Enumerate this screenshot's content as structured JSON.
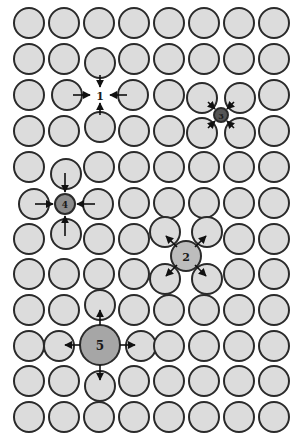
{
  "figure": {
    "type": "crystal-lattice-point-defects",
    "background": "#ffffff",
    "atom_fill": "#dcdcdc",
    "atom_stroke": "#2a2a2a",
    "atom_radius": 15,
    "columns_x": [
      29,
      64,
      99,
      134,
      169,
      204,
      239,
      274
    ],
    "rows_y": [
      23,
      59,
      95,
      131,
      167,
      203,
      239,
      274,
      310,
      346,
      381,
      417
    ],
    "removed_atoms": [
      [
        2,
        2
      ],
      [
        5,
        1
      ],
      [
        9,
        2
      ]
    ],
    "displaced_atoms": [
      {
        "row": 1,
        "col": 2,
        "x": 100,
        "y": 63
      },
      {
        "row": 2,
        "col": 1,
        "x": 67,
        "y": 95
      },
      {
        "row": 2,
        "col": 3,
        "x": 133,
        "y": 95
      },
      {
        "row": 3,
        "col": 2,
        "x": 100,
        "y": 127
      },
      {
        "row": 2,
        "col": 5,
        "x": 202,
        "y": 98
      },
      {
        "row": 2,
        "col": 6,
        "x": 240,
        "y": 98
      },
      {
        "row": 3,
        "col": 5,
        "x": 202,
        "y": 133
      },
      {
        "row": 3,
        "col": 6,
        "x": 240,
        "y": 133
      },
      {
        "row": 4,
        "col": 1,
        "x": 66,
        "y": 174
      },
      {
        "row": 5,
        "col": 0,
        "x": 34,
        "y": 204
      },
      {
        "row": 5,
        "col": 2,
        "x": 98,
        "y": 204
      },
      {
        "row": 6,
        "col": 1,
        "x": 66,
        "y": 234
      },
      {
        "row": 6,
        "col": 4,
        "x": 165,
        "y": 232
      },
      {
        "row": 6,
        "col": 5,
        "x": 207,
        "y": 232
      },
      {
        "row": 7,
        "col": 4,
        "x": 165,
        "y": 279
      },
      {
        "row": 7,
        "col": 5,
        "x": 207,
        "y": 279
      },
      {
        "row": 8,
        "col": 2,
        "x": 100,
        "y": 305
      },
      {
        "row": 9,
        "col": 1,
        "x": 59,
        "y": 346
      },
      {
        "row": 9,
        "col": 3,
        "x": 141,
        "y": 346
      },
      {
        "row": 10,
        "col": 2,
        "x": 100,
        "y": 386
      }
    ],
    "defects": [
      {
        "id": "1",
        "kind": "vacancy",
        "x": 100,
        "y": 95,
        "r": 0,
        "fill": "none",
        "label_size": 11,
        "arrows": [
          {
            "x1": 100,
            "y1": 75,
            "x2": 100,
            "y2": 87
          },
          {
            "x1": 100,
            "y1": 115,
            "x2": 100,
            "y2": 103
          },
          {
            "x1": 73,
            "y1": 95,
            "x2": 90,
            "y2": 95
          },
          {
            "x1": 127,
            "y1": 95,
            "x2": 110,
            "y2": 95
          }
        ]
      },
      {
        "id": "2",
        "kind": "substitutional-larger",
        "x": 186,
        "y": 256,
        "r": 15,
        "fill": "#bdbdbd",
        "label_size": 11,
        "arrows": [
          {
            "x1": 177,
            "y1": 247,
            "x2": 166,
            "y2": 236
          },
          {
            "x1": 195,
            "y1": 247,
            "x2": 206,
            "y2": 236
          },
          {
            "x1": 177,
            "y1": 265,
            "x2": 166,
            "y2": 276
          },
          {
            "x1": 195,
            "y1": 265,
            "x2": 206,
            "y2": 276
          }
        ]
      },
      {
        "id": "3",
        "kind": "interstitial-small",
        "x": 221,
        "y": 115,
        "r": 7,
        "fill": "#555555",
        "label_size": 8,
        "arrows": [
          {
            "x1": 208,
            "y1": 102,
            "x2": 215,
            "y2": 109
          },
          {
            "x1": 234,
            "y1": 102,
            "x2": 227,
            "y2": 109
          },
          {
            "x1": 208,
            "y1": 128,
            "x2": 215,
            "y2": 121
          },
          {
            "x1": 234,
            "y1": 128,
            "x2": 227,
            "y2": 121
          }
        ]
      },
      {
        "id": "4",
        "kind": "substitutional-smaller",
        "x": 65,
        "y": 204,
        "r": 10,
        "fill": "#8c8c8c",
        "label_size": 9,
        "arrows": [
          {
            "x1": 65,
            "y1": 173,
            "x2": 65,
            "y2": 192
          },
          {
            "x1": 65,
            "y1": 236,
            "x2": 65,
            "y2": 216
          },
          {
            "x1": 35,
            "y1": 204,
            "x2": 53,
            "y2": 204
          },
          {
            "x1": 95,
            "y1": 204,
            "x2": 77,
            "y2": 204
          }
        ]
      },
      {
        "id": "5",
        "kind": "interstitial-large",
        "x": 100,
        "y": 345,
        "r": 20,
        "fill": "#a6a6a6",
        "label_size": 12,
        "arrows": [
          {
            "x1": 100,
            "y1": 325,
            "x2": 100,
            "y2": 310
          },
          {
            "x1": 100,
            "y1": 365,
            "x2": 100,
            "y2": 380
          },
          {
            "x1": 80,
            "y1": 345,
            "x2": 65,
            "y2": 345
          },
          {
            "x1": 120,
            "y1": 345,
            "x2": 135,
            "y2": 345
          }
        ]
      }
    ],
    "labels": {
      "defect_1": "1",
      "defect_2": "2",
      "defect_3": "3",
      "defect_4": "4",
      "defect_5": "5"
    }
  }
}
